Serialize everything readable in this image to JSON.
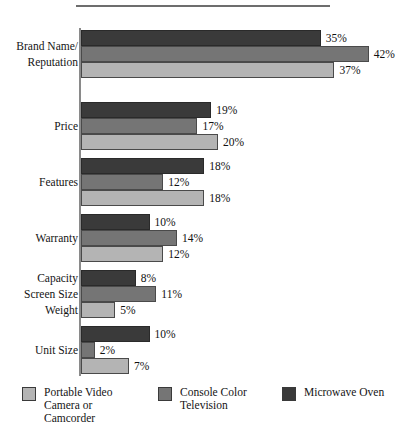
{
  "chart_data": {
    "type": "bar",
    "orientation": "horizontal",
    "title": "",
    "subtitle": "",
    "xlabel": "",
    "ylabel": "",
    "grid": false,
    "legend_position": "bottom",
    "value_suffix": "%",
    "xlim": [
      0,
      45
    ],
    "categories": [
      "Brand Name/\nReputation",
      "Price",
      "Features",
      "Warranty",
      "Capacity\nScreen Size\nWeight",
      "Unit Size"
    ],
    "series": [
      {
        "name": "Microwave Oven",
        "swatch": "s-dark",
        "color": "#3a3a3a",
        "values": [
          35,
          19,
          18,
          10,
          8,
          10
        ],
        "labels": [
          "35%",
          "19%",
          "18%",
          "10%",
          "8%",
          "10%"
        ]
      },
      {
        "name": "Console Color\nTelevision",
        "swatch": "s-medium",
        "color": "#757575",
        "values": [
          42,
          17,
          12,
          14,
          11,
          2
        ],
        "labels": [
          "42%",
          "17%",
          "12%",
          "14%",
          "11%",
          "2%"
        ]
      },
      {
        "name": "Portable Video\nCamera or\nCamcorder",
        "swatch": "s-light",
        "color": "#b4b4b4",
        "values": [
          37,
          20,
          18,
          12,
          5,
          7
        ],
        "labels": [
          "37%",
          "20%",
          "18%",
          "12%",
          "5%",
          "7%"
        ]
      }
    ]
  },
  "legend": {
    "items": [
      {
        "label": "Portable Video\nCamera or\nCamcorder",
        "swatch": "s-light"
      },
      {
        "label": "Console Color\nTelevision",
        "swatch": "s-medium"
      },
      {
        "label": "Microwave Oven",
        "swatch": "s-dark"
      }
    ]
  }
}
